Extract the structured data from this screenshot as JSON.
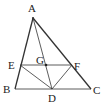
{
  "diagram": {
    "type": "geometry",
    "colors": {
      "line": "#333333",
      "text": "#222222",
      "background": "#ffffff"
    },
    "points": {
      "A": {
        "label": "A",
        "x": 33,
        "y": 18,
        "lx": 28,
        "ly": 12
      },
      "B": {
        "label": "B",
        "x": 15,
        "y": 89,
        "lx": 3,
        "ly": 93
      },
      "C": {
        "label": "C",
        "x": 91,
        "y": 89,
        "lx": 93,
        "ly": 94
      },
      "D": {
        "label": "D",
        "x": 52,
        "y": 89,
        "lx": 48,
        "ly": 102
      },
      "E": {
        "label": "E",
        "x": 20,
        "y": 65,
        "lx": 8,
        "ly": 69
      },
      "F": {
        "label": "F",
        "x": 72,
        "y": 65,
        "lx": 74,
        "ly": 70
      },
      "G": {
        "label": "G",
        "x": 46,
        "y": 65,
        "lx": 36,
        "ly": 64
      }
    },
    "segments": [
      [
        "A",
        "B"
      ],
      [
        "A",
        "C"
      ],
      [
        "B",
        "C"
      ],
      [
        "A",
        "D"
      ],
      [
        "E",
        "F"
      ],
      [
        "E",
        "D"
      ],
      [
        "F",
        "D"
      ]
    ]
  }
}
